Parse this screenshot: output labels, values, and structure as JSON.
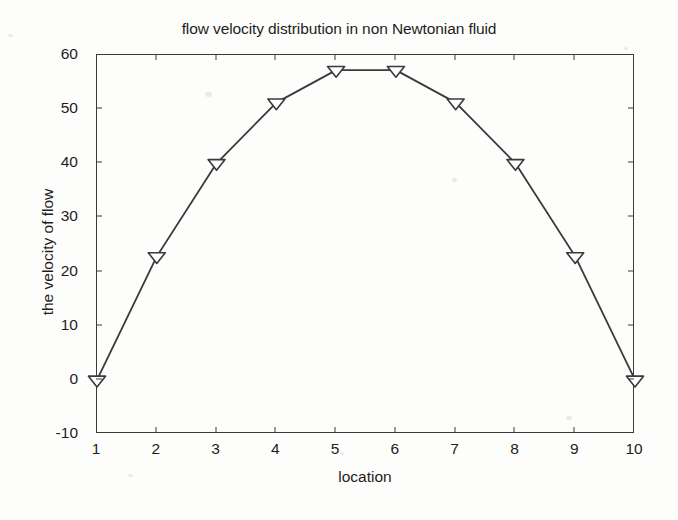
{
  "figure": {
    "background_color": "#fdfdfc",
    "axis_color": "#3b3b3b",
    "series_color": "#3a3a3a"
  },
  "chart_data": {
    "type": "line",
    "title": "flow velocity distribution in non Newtonian fluid",
    "xlabel": "location",
    "ylabel": "the velocity of flow",
    "x": [
      1,
      2,
      3,
      4,
      5,
      6,
      7,
      8,
      9,
      10
    ],
    "values": [
      0,
      22.8,
      40,
      51.2,
      57.2,
      57.2,
      51.2,
      40,
      22.8,
      0
    ],
    "series": [
      {
        "name": "flow velocity",
        "marker": "triangle-down",
        "line_style": "solid",
        "color": "#3a3a3a",
        "values": [
          0,
          22.8,
          40,
          51.2,
          57.2,
          57.2,
          51.2,
          40,
          22.8,
          0
        ]
      }
    ],
    "xlim": [
      1,
      10
    ],
    "ylim": [
      -10,
      60
    ],
    "xticks": [
      1,
      2,
      3,
      4,
      5,
      6,
      7,
      8,
      9,
      10
    ],
    "yticks": [
      -10,
      0,
      10,
      20,
      30,
      40,
      50,
      60
    ],
    "xtick_labels": [
      "1",
      "2",
      "3",
      "4",
      "5",
      "6",
      "7",
      "8",
      "9",
      "10"
    ],
    "ytick_labels": [
      "-10",
      "0",
      "10",
      "20",
      "30",
      "40",
      "50",
      "60"
    ],
    "grid": false,
    "legend": null,
    "box": true
  }
}
